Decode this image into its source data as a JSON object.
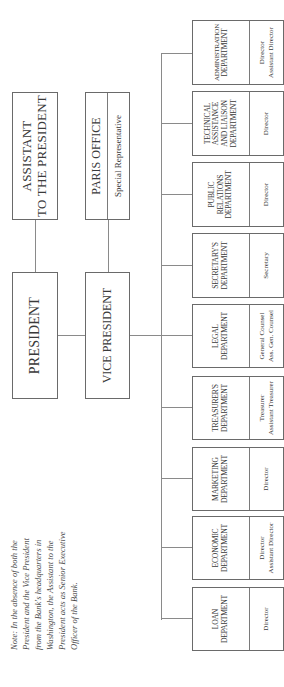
{
  "chart": {
    "top_level": {
      "assistant": "ASSISTANT TO THE PRESIDENT",
      "assistant_line1": "ASSISTANT",
      "assistant_line2": "TO THE PRESIDENT",
      "paris_office": "PARIS OFFICE",
      "paris_role": "Special Representative",
      "president": "PRESIDENT",
      "vice_president": "VICE PRESIDENT"
    },
    "departments": [
      {
        "name_l1": "LOAN",
        "name_l2": "DEPARTMENT",
        "name_l3": "",
        "name_l4": "",
        "roles": [
          "Director",
          ""
        ]
      },
      {
        "name_l1": "ECONOMIC",
        "name_l2": "DEPARTMENT",
        "name_l3": "",
        "name_l4": "",
        "roles": [
          "Director",
          "Assistant Director"
        ]
      },
      {
        "name_l1": "MARKETING",
        "name_l2": "DEPARTMENT",
        "name_l3": "",
        "name_l4": "",
        "roles": [
          "Director",
          ""
        ]
      },
      {
        "name_l1": "TREASURER'S",
        "name_l2": "DEPARTMENT",
        "name_l3": "",
        "name_l4": "",
        "roles": [
          "Treasurer",
          "Assistant Treasurer"
        ]
      },
      {
        "name_l1": "LEGAL",
        "name_l2": "DEPARTMENT",
        "name_l3": "",
        "name_l4": "",
        "roles": [
          "General Counsel",
          "Ass. Gen. Counsel"
        ]
      },
      {
        "name_l1": "SECRETARY'S",
        "name_l2": "DEPARTMENT",
        "name_l3": "",
        "name_l4": "",
        "roles": [
          "Secretary",
          ""
        ]
      },
      {
        "name_l1": "PUBLIC",
        "name_l2": "RELATIONS",
        "name_l3": "DEPARTMENT",
        "name_l4": "",
        "roles": [
          "Director",
          ""
        ]
      },
      {
        "name_l1": "TECHNICAL",
        "name_l2": "ASSISTANCE",
        "name_l3": "AND LIAISON",
        "name_l4": "DEPARTMENT",
        "roles": [
          "Director",
          ""
        ]
      },
      {
        "name_l1": "ADMINISTRATION",
        "name_l2": "DEPARTMENT",
        "name_l3": "",
        "name_l4": "",
        "roles": [
          "Director",
          "Assistant Director"
        ]
      }
    ],
    "note": "Note: In the absence of both the\nPresident and the Vice President\nfrom the Bank's headquarters in\nWashington, the Assistant to the\nPresident acts as Senior Executive\nOfficer of the Bank."
  }
}
